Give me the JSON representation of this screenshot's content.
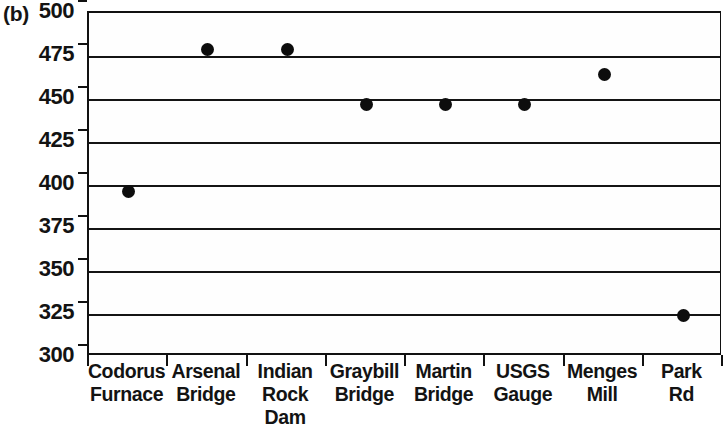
{
  "figure": {
    "panel_label": "(b)"
  },
  "chart_data": {
    "type": "scatter",
    "title": "",
    "xlabel": "",
    "ylabel": "",
    "ylim": [
      300,
      500
    ],
    "yticks": [
      500,
      475,
      450,
      425,
      400,
      375,
      350,
      325,
      300
    ],
    "ytick_labels": [
      "500",
      "475",
      "450",
      "425",
      "400",
      "375",
      "350",
      "325",
      "300"
    ],
    "grid": true,
    "legend": "none",
    "categories": [
      "Codorus Furnace",
      "Arsenal Bridge",
      "Indian Rock Dam",
      "Graybill Bridge",
      "Martin Bridge",
      "USGS Gauge",
      "Menges Mill",
      "Park Rd"
    ],
    "category_lines": [
      [
        "Codorus",
        "Furnace"
      ],
      [
        "Arsenal",
        "Bridge"
      ],
      [
        "Indian",
        "Rock",
        "Dam"
      ],
      [
        "Graybill",
        "Bridge"
      ],
      [
        "Martin",
        "Bridge"
      ],
      [
        "USGS",
        "Gauge"
      ],
      [
        "Menges",
        "Mill"
      ],
      [
        "Park",
        "Rd"
      ]
    ],
    "values": [
      396,
      479,
      479,
      447,
      447,
      447,
      464,
      324
    ],
    "marker": "filled-circle",
    "marker_color": "#0d0d0d"
  }
}
